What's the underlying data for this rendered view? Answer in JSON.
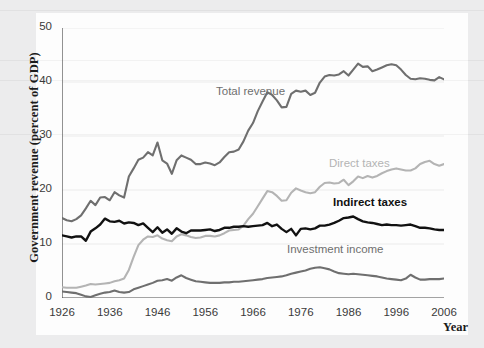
{
  "chart_data": {
    "type": "line",
    "title": "",
    "xlabel": "Year",
    "ylabel": "Government revenue (percent of GDP)",
    "xlim": [
      1926,
      2006
    ],
    "ylim": [
      0,
      50
    ],
    "grid": false,
    "legend_position": "inline-annotations",
    "y_ticks": [
      0,
      10,
      20,
      30,
      40,
      50
    ],
    "x_ticks": [
      1926,
      1936,
      1946,
      1956,
      1966,
      1976,
      1986,
      1996,
      2006
    ],
    "x_minor_tick_interval": 2,
    "colors": {
      "total_revenue": "#6f6f6f",
      "direct_taxes": "#b4b4b4",
      "indirect_taxes": "#111111",
      "investment_income": "#6f6f6f",
      "plot_background": "#fdfdfd",
      "figure_background": "#ececed",
      "axis": "#4a4a4a"
    },
    "x": [
      1926,
      1927,
      1928,
      1929,
      1930,
      1931,
      1932,
      1933,
      1934,
      1935,
      1936,
      1937,
      1938,
      1939,
      1940,
      1941,
      1942,
      1943,
      1944,
      1945,
      1946,
      1947,
      1948,
      1949,
      1950,
      1951,
      1952,
      1953,
      1954,
      1955,
      1956,
      1957,
      1958,
      1959,
      1960,
      1961,
      1962,
      1963,
      1964,
      1965,
      1966,
      1967,
      1968,
      1969,
      1970,
      1971,
      1972,
      1973,
      1974,
      1975,
      1976,
      1977,
      1978,
      1979,
      1980,
      1981,
      1982,
      1983,
      1984,
      1985,
      1986,
      1987,
      1988,
      1989,
      1990,
      1991,
      1992,
      1993,
      1994,
      1995,
      1996,
      1997,
      1998,
      1999,
      2000,
      2001,
      2002,
      2003,
      2004,
      2005,
      2006
    ],
    "series": [
      {
        "name": "Total revenue",
        "values": [
          14.8,
          14.4,
          14.2,
          14.6,
          15.3,
          16.6,
          18.0,
          17.2,
          18.6,
          18.7,
          18.1,
          19.6,
          19.0,
          18.6,
          22.5,
          24.0,
          25.6,
          26.0,
          27.0,
          26.4,
          28.8,
          25.5,
          24.9,
          23.0,
          25.5,
          26.4,
          26.0,
          25.6,
          24.8,
          24.8,
          25.1,
          24.9,
          24.6,
          25.1,
          26.1,
          27.0,
          27.1,
          27.5,
          29.0,
          31.0,
          32.4,
          34.6,
          36.4,
          38.1,
          37.6,
          36.6,
          35.3,
          35.4,
          37.8,
          38.4,
          38.2,
          38.4,
          37.6,
          38.0,
          39.9,
          41.0,
          41.3,
          41.2,
          41.4,
          42.0,
          41.2,
          42.3,
          43.4,
          42.8,
          42.9,
          42.0,
          42.3,
          42.7,
          43.1,
          43.3,
          43.1,
          42.3,
          41.3,
          40.6,
          40.5,
          40.7,
          40.6,
          40.4,
          40.3,
          40.9,
          40.5
        ]
      },
      {
        "name": "Direct taxes",
        "values": [
          2.0,
          1.9,
          1.9,
          1.9,
          2.1,
          2.3,
          2.6,
          2.5,
          2.6,
          2.7,
          2.8,
          3.1,
          3.3,
          3.6,
          5.2,
          7.6,
          9.8,
          10.8,
          11.4,
          11.3,
          11.6,
          11.0,
          10.7,
          10.5,
          11.4,
          11.8,
          11.6,
          11.3,
          11.1,
          11.2,
          11.5,
          11.5,
          11.4,
          11.6,
          12.0,
          12.5,
          12.6,
          12.7,
          13.4,
          14.6,
          15.6,
          17.0,
          18.4,
          19.8,
          19.6,
          18.9,
          18.0,
          18.1,
          19.5,
          20.3,
          19.9,
          19.6,
          19.4,
          19.6,
          20.6,
          21.3,
          21.4,
          21.2,
          21.3,
          21.9,
          20.9,
          21.6,
          22.5,
          22.2,
          22.6,
          22.3,
          22.6,
          23.1,
          23.5,
          23.8,
          24.0,
          23.8,
          23.6,
          23.6,
          24.0,
          24.8,
          25.2,
          25.4,
          24.8,
          24.5,
          24.8
        ]
      },
      {
        "name": "Indirect taxes",
        "values": [
          11.6,
          11.4,
          11.2,
          11.4,
          11.4,
          10.6,
          12.3,
          12.9,
          13.6,
          14.7,
          14.2,
          14.1,
          14.3,
          13.8,
          14.0,
          13.9,
          13.5,
          13.8,
          13.0,
          12.2,
          13.1,
          12.1,
          12.7,
          11.9,
          12.9,
          12.3,
          12.0,
          12.5,
          12.5,
          12.5,
          12.6,
          12.7,
          12.4,
          12.6,
          13.0,
          13.0,
          13.2,
          13.2,
          13.3,
          13.2,
          13.3,
          13.4,
          13.5,
          13.9,
          13.3,
          13.6,
          12.8,
          12.2,
          12.8,
          11.6,
          12.8,
          12.9,
          12.7,
          12.9,
          13.4,
          13.4,
          13.6,
          13.9,
          14.3,
          14.8,
          14.9,
          15.1,
          14.6,
          14.2,
          14.0,
          13.9,
          13.7,
          13.5,
          13.6,
          13.5,
          13.5,
          13.4,
          13.5,
          13.6,
          13.3,
          13.0,
          13.0,
          12.9,
          12.7,
          12.6,
          12.6
        ]
      },
      {
        "name": "Investment income",
        "values": [
          1.2,
          1.1,
          1.0,
          0.9,
          0.6,
          0.3,
          0.2,
          0.5,
          0.8,
          1.0,
          1.1,
          1.4,
          1.1,
          1.0,
          1.1,
          1.6,
          1.9,
          2.2,
          2.5,
          2.8,
          3.2,
          3.3,
          3.5,
          3.2,
          3.8,
          4.2,
          3.7,
          3.4,
          3.1,
          3.0,
          2.9,
          2.8,
          2.8,
          2.8,
          2.9,
          2.9,
          3.0,
          3.0,
          3.1,
          3.2,
          3.3,
          3.4,
          3.5,
          3.7,
          3.8,
          3.9,
          4.0,
          4.2,
          4.5,
          4.7,
          4.9,
          5.1,
          5.4,
          5.6,
          5.7,
          5.5,
          5.3,
          4.9,
          4.6,
          4.5,
          4.4,
          4.5,
          4.4,
          4.3,
          4.2,
          4.1,
          4.0,
          3.8,
          3.6,
          3.5,
          3.4,
          3.3,
          3.6,
          4.3,
          3.8,
          3.4,
          3.4,
          3.5,
          3.5,
          3.5,
          3.6
        ]
      }
    ],
    "annotations": [
      {
        "text": "Total revenue",
        "x_px": 216,
        "y_px": 85
      },
      {
        "text": "Direct taxes",
        "x_px": 329,
        "y_px": 157
      },
      {
        "text": "Indirect taxes",
        "x_px": 333,
        "y_px": 196
      },
      {
        "text": "Investment income",
        "x_px": 287,
        "y_px": 243
      }
    ]
  }
}
